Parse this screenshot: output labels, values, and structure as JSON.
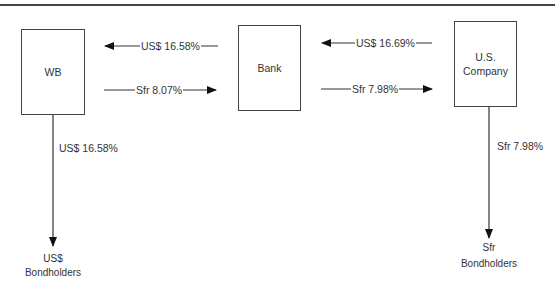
{
  "diagram": {
    "nodes": {
      "wb": {
        "label": "WB"
      },
      "bank": {
        "label": "Bank"
      },
      "us_company": {
        "label_line1": "U.S.",
        "label_line2": "Company"
      },
      "us_bondholders": {
        "label_line1": "US$",
        "label_line2": "Bondholders"
      },
      "sfr_bondholders": {
        "label_line1": "Sfr",
        "label_line2": "Bondholders"
      }
    },
    "flows": {
      "bank_to_wb": "US$ 16.58%",
      "wb_to_bank": "Sfr 8.07%",
      "company_to_bank": "US$ 16.69%",
      "bank_to_company": "Sfr 7.98%",
      "wb_to_us_bondholders": "US$ 16.58%",
      "company_to_sfr_bondholders": "Sfr 7.98%"
    }
  }
}
